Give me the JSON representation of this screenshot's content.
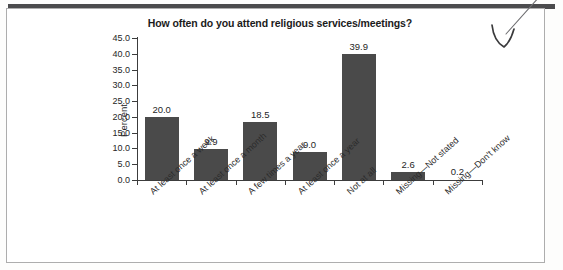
{
  "figure": {
    "title": "How often do you attend religious services/meetings?",
    "axis_title_y": "Percent",
    "bar_color": "#4a4a4a",
    "axis_color": "#3c3c3c",
    "frame_color": "#adadad",
    "top_rule_color": "#4b4b4d",
    "annotation": {
      "type": "hand-drawn-pen-arrow",
      "description": "downward pointing hand drawn arrow at top right"
    }
  },
  "chart_data": {
    "type": "bar",
    "title": "How often do you attend religious services/meetings?",
    "xlabel": "",
    "ylabel": "Percent",
    "ylim": [
      0.0,
      45.0
    ],
    "ytick_step": 5.0,
    "yticks": [
      "45.0",
      "40.0",
      "35.0",
      "30.0",
      "25.0",
      "20.0",
      "15.0",
      "10.0",
      "5.0",
      "0.0"
    ],
    "grid": false,
    "legend": "none",
    "categories": [
      "At least once a week",
      "At least once a month",
      "A few times a year",
      "At least once a year",
      "Not at all",
      "Missing—Not stated",
      "Missing—Don't know"
    ],
    "values": [
      20.0,
      9.9,
      18.5,
      9.0,
      39.9,
      2.6,
      0.2
    ],
    "value_labels": [
      "20.0",
      "9.9",
      "18.5",
      "9.0",
      "39.9",
      "2.6",
      "0.2"
    ]
  }
}
